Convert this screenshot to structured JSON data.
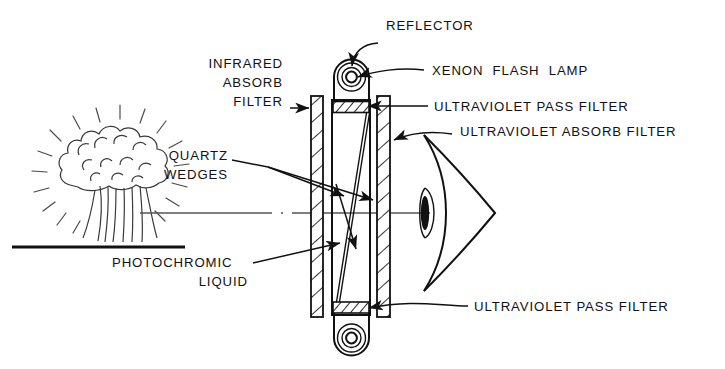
{
  "figure": {
    "background_color": "#ffffff",
    "ink_color": "#111111"
  },
  "labels": {
    "reflector": "REFLECTOR",
    "xenon_flash_lamp": "XENON  FLASH  LAMP",
    "uv_pass_filter_top": "ULTRAVIOLET PASS FILTER",
    "uv_absorb_filter": "ULTRAVIOLET ABSORB FILTER",
    "uv_pass_filter_bottom": "ULTRAVIOLET PASS FILTER",
    "infrared_absorb_filter_line1": "INFRARED",
    "infrared_absorb_filter_line2": "ABSORB",
    "infrared_absorb_filter_line3": "FILTER",
    "quartz_wedges_line1": "QUARTZ",
    "quartz_wedges_line2": "WEDGES",
    "photochromic_liquid_line1": "PHOTOCHROMIC",
    "photochromic_liquid_line2": "LIQUID"
  },
  "parts": {
    "explosion": "nuclear-fireball-mushroom-cloud",
    "ground": "ground-line",
    "optical_axis": "optical-axis-centerline",
    "eye": "human-eye-cross-section",
    "lamp_housing_top": "reflector-housing-top",
    "lamp_housing_bottom": "reflector-housing-bottom",
    "cell": "photochromic-liquid-cell",
    "wedge_upper": "quartz-wedge-upper",
    "wedge_lower": "quartz-wedge-lower",
    "plate_left": "infrared-absorb-filter-plate",
    "plate_right": "ultraviolet-absorb-filter-plate",
    "band_top": "ultraviolet-pass-filter-band-top",
    "band_bottom": "ultraviolet-pass-filter-band-bottom"
  }
}
